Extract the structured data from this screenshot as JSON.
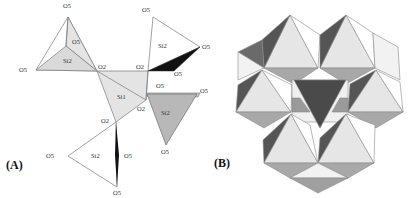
{
  "figure": {
    "panels": [
      {
        "id": "A",
        "label": "(A)"
      },
      {
        "id": "B",
        "label": "(B)"
      }
    ],
    "colors": {
      "light_fill": "#e4e4e4",
      "medium_fill": "#b8b8b8",
      "dark_fill": "#555555",
      "black_fill": "#111111",
      "stroke": "#7a7a7a"
    },
    "panel_a": {
      "atom_labels": {
        "o5_top_left": "O5",
        "o5_inner_left": "O5",
        "si2_left": "Si2",
        "o5_far_left": "O5",
        "o2_left": "O2",
        "o2_center": "O2",
        "o5_top_right": "O5",
        "si2_top_right": "Si2",
        "o5_right_upper": "O5",
        "o5_mid": "O5",
        "o5_right_mid": "O5",
        "o5_shelf": "O5",
        "si1": "Si1",
        "o2_right": "O2",
        "si2_right": "Si2",
        "o5_bottom_right": "O5",
        "o2_lower": "O2",
        "o5_lower_left": "O5",
        "si2_lower": "Si2",
        "o5_lower_right": "O5",
        "o5_bottom": "O5"
      }
    }
  }
}
